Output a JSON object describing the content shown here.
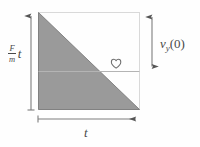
{
  "figure": {
    "kind": "kinematics-velocity-time-diagram",
    "background_color": "#fefefe",
    "frame": {
      "stroke_color": "#d8d8d8",
      "x": 38,
      "y": 12,
      "width": 102,
      "height": 98
    },
    "triangle": {
      "fill_color": "#9a9a9a",
      "edge_color": "#6e6e6e",
      "vertices": [
        [
          38,
          12
        ],
        [
          38,
          110
        ],
        [
          140,
          110
        ]
      ],
      "description": "right triangle filled gray, hypotenuse from top-left to bottom-right"
    },
    "divider_line": {
      "stroke_color": "#b6b6b6",
      "y": 71,
      "x_start": 38,
      "x_end": 140
    },
    "heart_marker": {
      "glyph": "heart-outline",
      "symbol": "♡",
      "x": 114,
      "y": 64,
      "stroke_color": "#6f6f6f"
    },
    "measures": [
      {
        "name": "left-vertical-measure",
        "orientation": "vertical",
        "arrow_ends": "top",
        "x": 31,
        "y_start": 110,
        "y_end": 12,
        "stroke_color": "#7d7d7d"
      },
      {
        "name": "right-vertical-measure",
        "orientation": "vertical",
        "arrow_ends": "both",
        "x": 152,
        "y_start": 12,
        "y_end": 71,
        "stroke_color": "#7d7d7d"
      },
      {
        "name": "bottom-horizontal-measure",
        "orientation": "horizontal",
        "arrow_ends": "right",
        "y": 119,
        "x_start": 38,
        "x_end": 140,
        "stroke_color": "#7d7d7d"
      }
    ],
    "labels": {
      "accel_numerator": "F",
      "accel_denominator": "m",
      "accel_time_var": "t",
      "accel_full": "F/m t",
      "initial_velocity": "v",
      "initial_velocity_subscript": "y",
      "initial_velocity_argument": "(0)",
      "initial_velocity_full": "v_y(0)",
      "time": "t"
    }
  }
}
